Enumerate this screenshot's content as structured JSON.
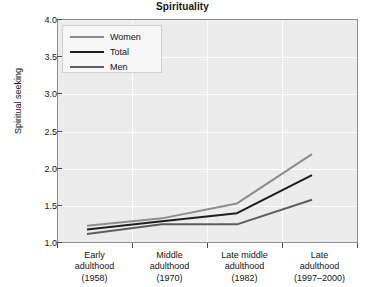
{
  "chart_data": {
    "type": "line",
    "title": "Spirituality",
    "xlabel": "",
    "ylabel": "Spiritual seeking",
    "ylim": [
      1.0,
      4.0
    ],
    "ytick_labels": [
      "4.0",
      "3.5",
      "3.0",
      "2.5",
      "2.0",
      "1.5",
      "1.0"
    ],
    "yticks": [
      4.0,
      3.5,
      3.0,
      2.5,
      2.0,
      1.5,
      1.0
    ],
    "grid": "horizontal-and-vertical-white",
    "legend_position": "top-left-inside",
    "categories": [
      "Early\nadulthood\n(1958)",
      "Middle\nadulthood\n(1970)",
      "Late middle\nadulthood\n(1982)",
      "Late\nadulthood\n(1997–2000)"
    ],
    "category_lines": [
      [
        "Early",
        "adulthood",
        "(1958)"
      ],
      [
        "Middle",
        "adulthood",
        "(1970)"
      ],
      [
        "Late middle",
        "adulthood",
        "(1982)"
      ],
      [
        "Late",
        "adulthood",
        "(1997–2000)"
      ]
    ],
    "series": [
      {
        "name": "Women",
        "color": "#8c8c8c",
        "values": [
          1.23,
          1.33,
          1.53,
          2.19
        ]
      },
      {
        "name": "Total",
        "color": "#1e1e1e",
        "values": [
          1.18,
          1.29,
          1.4,
          1.91
        ]
      },
      {
        "name": "Men",
        "color": "#5e5e5e",
        "values": [
          1.12,
          1.25,
          1.25,
          1.58
        ]
      }
    ]
  },
  "legend": {
    "items": [
      {
        "label": "Women",
        "color": "#8c8c8c"
      },
      {
        "label": "Total",
        "color": "#1e1e1e"
      },
      {
        "label": "Men",
        "color": "#5e5e5e"
      }
    ]
  },
  "colors": {
    "plot_background": "#ececec",
    "gridline": "#fdfdfd",
    "axis": "#8d8d8d",
    "text": "#141414",
    "page_background": "#ffffff"
  }
}
